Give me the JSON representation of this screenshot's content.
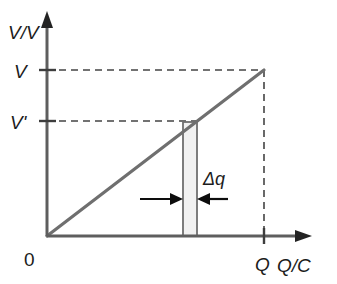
{
  "figure": {
    "type": "line-diagram",
    "title": "",
    "background_color": "#ffffff"
  },
  "axes": {
    "y": {
      "label": "V/V",
      "label_icon": "y-axis-arrow-icon",
      "color": "#5e5e5e",
      "origin_px": 236,
      "tip_px": 12
    },
    "x": {
      "label": "Q/C",
      "label_icon": "x-axis-arrow-icon",
      "color": "#5e5e5e",
      "origin_px": 47,
      "tip_px": 312
    },
    "origin_label": "0"
  },
  "ticks": {
    "y": [
      {
        "label": "V",
        "value_px": 70
      },
      {
        "label": "V'",
        "value_px": 121
      }
    ],
    "x": [
      {
        "label": "Q",
        "value_px": 263
      }
    ]
  },
  "series": {
    "name": "voltage-charge-line",
    "description": "straight line through origin",
    "color": "#6f6f6f",
    "from": {
      "x": 47,
      "y": 236
    },
    "to": {
      "x": 264,
      "y": 70
    }
  },
  "guides": [
    {
      "name": "dashed-guide-V",
      "orientation": "horizontal",
      "from_px": 47,
      "to_px": 265,
      "at_px": 70
    },
    {
      "name": "dashed-guide-Vprime",
      "orientation": "horizontal",
      "from_px": 47,
      "to_px": 198,
      "at_px": 121
    },
    {
      "name": "dashed-guide-Q",
      "orientation": "vertical",
      "from_px": 70,
      "to_px": 236,
      "at_px": 264
    }
  ],
  "strip": {
    "name": "delta-q-strip",
    "label": "Δq",
    "fill_color": "#f1f1f1",
    "stroke_color": "#6f6f6f",
    "left_px": 183,
    "right_px": 197,
    "top_px": 122,
    "bottom_px": 236
  },
  "arrows": {
    "color": "#0d0d0d",
    "left": {
      "from_px": 140,
      "to_px": 182,
      "at_px": 199
    },
    "right": {
      "from_px": 228,
      "to_px": 198,
      "at_px": 199
    }
  },
  "colors": {
    "ink": "#1c1c1c",
    "axis_gray": "#5e5e5e",
    "line_gray": "#6f6f6f",
    "strip_fill": "#f1f1f1",
    "arrow_black": "#0d0d0d"
  }
}
